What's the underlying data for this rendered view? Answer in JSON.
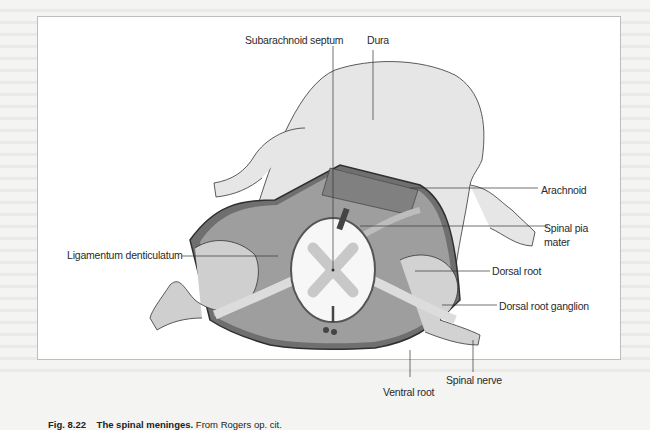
{
  "figure": {
    "labels": {
      "subarachnoid_septum": "Subarachnoid septum",
      "dura": "Dura",
      "arachnoid": "Arachnoid",
      "spinal_pia_mater_line1": "Spinal pia",
      "spinal_pia_mater_line2": "mater",
      "ligamentum_denticulatum": "Ligamentum denticulatum",
      "dorsal_root": "Dorsal root",
      "dorsal_root_ganglion": "Dorsal root ganglion",
      "spinal_nerve": "Spinal nerve",
      "ventral_root": "Ventral root"
    },
    "caption": {
      "number": "Fig. 8.22",
      "title": "The spinal meninges.",
      "source": "From Rogers op. cit."
    }
  }
}
